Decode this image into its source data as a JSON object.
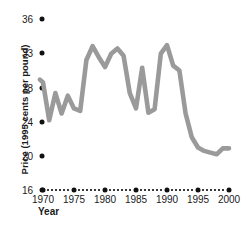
{
  "chart_data": {
    "type": "line",
    "title": "",
    "xlabel": "Year",
    "ylabel": "Price (1995 cents per pound)",
    "series_name": "Price",
    "line_color": "#9a9a9a",
    "axis_color": "#111111",
    "grid": false,
    "legend": "none",
    "xlim": [
      1969,
      2001
    ],
    "ylim": [
      16,
      36
    ],
    "x_ticks": [
      1970,
      1975,
      1980,
      1985,
      1990,
      1995,
      2000
    ],
    "x_tick_labels": [
      "1970",
      "1975",
      "1980",
      "1985",
      "1990",
      "1995",
      "2000"
    ],
    "y_ticks": [
      36,
      33,
      28,
      24,
      20,
      16
    ],
    "y_tick_labels": [
      "36",
      "33",
      "28",
      "24",
      "20",
      "16"
    ],
    "x": [
      1969.5,
      1970,
      1971,
      1972,
      1973,
      1974,
      1975,
      1976,
      1977,
      1978,
      1979,
      1980,
      1981,
      1982,
      1983,
      1984,
      1985,
      1986,
      1987,
      1988,
      1989,
      1990,
      1991,
      1992,
      1993,
      1994,
      1995,
      1996,
      1997,
      1998,
      1999,
      2000
    ],
    "values": [
      29.2,
      28.8,
      24.2,
      27.4,
      25.0,
      27.1,
      25.6,
      25.3,
      32.0,
      33.6,
      32.4,
      31.0,
      32.9,
      33.4,
      32.6,
      27.4,
      25.6,
      30.9,
      25.1,
      25.5,
      32.9,
      33.7,
      31.2,
      30.5,
      25.0,
      22.2,
      21.0,
      20.6,
      20.4,
      20.2,
      20.9,
      20.9
    ]
  }
}
